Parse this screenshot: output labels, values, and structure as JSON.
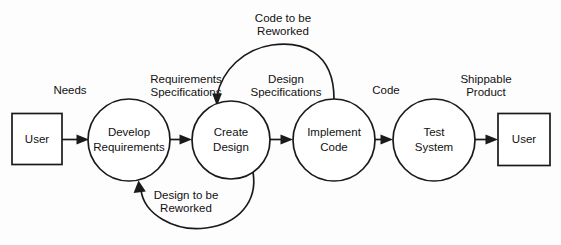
{
  "diagram": {
    "type": "data-flow-diagram",
    "style": {
      "background_color": "#fdfdfd",
      "stroke_color": "#1a1a1a",
      "text_color": "#111111",
      "fill_color": "#ffffff"
    },
    "nodes": [
      {
        "id": "user-source",
        "shape": "rectangle",
        "label": "User",
        "cx": 37,
        "cy": 139,
        "w": 50,
        "h": 51
      },
      {
        "id": "develop-requirements",
        "shape": "circle",
        "label_line1": "Develop",
        "label_line2": "Requirements",
        "cx": 129,
        "cy": 140,
        "r": 41
      },
      {
        "id": "create-design",
        "shape": "circle",
        "label_line1": "Create",
        "label_line2": "Design",
        "cx": 231,
        "cy": 140,
        "r": 39
      },
      {
        "id": "implement-code",
        "shape": "circle",
        "label_line1": "Implement",
        "label_line2": "Code",
        "cx": 334,
        "cy": 140,
        "r": 41
      },
      {
        "id": "test-system",
        "shape": "circle",
        "label_line1": "Test",
        "label_line2": "System",
        "cx": 434,
        "cy": 140,
        "r": 41
      },
      {
        "id": "user-sink",
        "shape": "rectangle",
        "label": "User",
        "cx": 524,
        "cy": 139,
        "w": 52,
        "h": 52
      }
    ],
    "edges": [
      {
        "id": "needs",
        "from": "user-source",
        "to": "develop-requirements",
        "label": "Needs",
        "direction": "right"
      },
      {
        "id": "requirements-specifications",
        "from": "develop-requirements",
        "to": "create-design",
        "label_line1": "Requirements",
        "label_line2": "Specifications",
        "direction": "right"
      },
      {
        "id": "design-specifications",
        "from": "create-design",
        "to": "implement-code",
        "label_line1": "Design",
        "label_line2": "Specifications",
        "direction": "right"
      },
      {
        "id": "code",
        "from": "implement-code",
        "to": "test-system",
        "label": "Code",
        "direction": "right"
      },
      {
        "id": "shippable-product",
        "from": "test-system",
        "to": "user-sink",
        "label_line1": "Shippable",
        "label_line2": "Product",
        "direction": "right"
      },
      {
        "id": "code-to-be-reworked",
        "from": "implement-code",
        "to": "create-design",
        "label_line1": "Code to be",
        "label_line2": "Reworked",
        "direction": "feedback-top"
      },
      {
        "id": "design-to-be-reworked",
        "from": "create-design",
        "to": "develop-requirements",
        "label_line1": "Design to be",
        "label_line2": "Reworked",
        "direction": "feedback-bottom"
      }
    ]
  }
}
